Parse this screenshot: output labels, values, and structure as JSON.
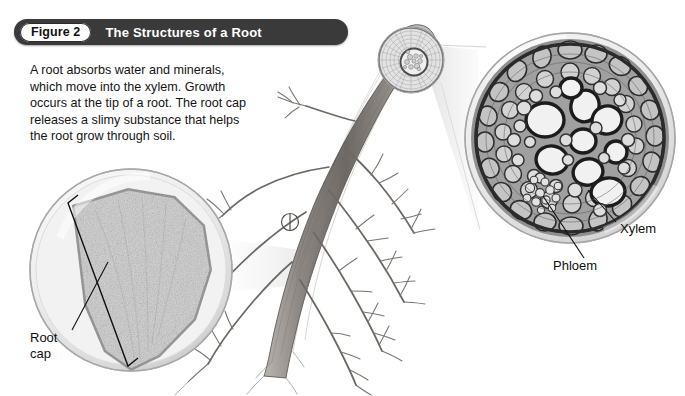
{
  "figure": {
    "number_label": "Figure 2",
    "title": "The Structures of a Root",
    "caption": "A root absorbs water and minerals, which move into the xylem. Growth occurs at the tip of a root. The root cap releases a slimy substance that helps the root grow through soil.",
    "banner_color": "#3a3a3a",
    "banner_text_color": "#ffffff",
    "background_color": "#ffffff"
  },
  "labels": {
    "root_cap": "Root\ncap",
    "phloem": "Phloem",
    "xylem": "Xylem"
  },
  "illustrations": {
    "root_drawing": "pencil-drawing-of-taproot-with-lateral-branch-roots",
    "left_inset": "light-micrograph-of-root-tip-longitudinal-section",
    "top_inset": "small-circular-root-cross-section-diagram",
    "right_inset": "light-micrograph-of-root-vascular-cylinder-cross-section"
  }
}
